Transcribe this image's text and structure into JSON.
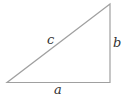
{
  "diagram": {
    "type": "right-triangle",
    "vertices": {
      "bottom_left": [
        7,
        82.5
      ],
      "bottom_right": [
        110,
        82.5
      ],
      "top_right": [
        110,
        4
      ]
    },
    "stroke_color": "#a0a0a0",
    "label_color": "#333333",
    "labels": {
      "hypotenuse": "c",
      "vertical_side": "b",
      "horizontal_side": "a"
    }
  }
}
